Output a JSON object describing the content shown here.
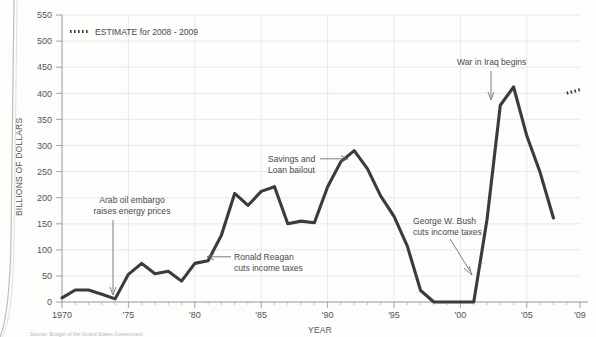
{
  "chart_data": {
    "type": "line",
    "title": "",
    "xlabel": "YEAR",
    "ylabel": "BILLIONS OF DOLLARS",
    "xlim": [
      1970,
      2009
    ],
    "ylim": [
      0,
      550
    ],
    "ytick_values": [
      0,
      50,
      100,
      150,
      200,
      250,
      300,
      350,
      400,
      450,
      500,
      550
    ],
    "ytick_labels": [
      "0",
      "50",
      "100",
      "150",
      "200",
      "250",
      "300",
      "350",
      "400",
      "450",
      "500",
      "550"
    ],
    "xtick_values": [
      1970,
      1975,
      1980,
      1985,
      1990,
      1995,
      2000,
      2005,
      2009
    ],
    "xtick_labels": [
      "1970",
      "'75",
      "'80",
      "'85",
      "'90",
      "'95",
      "'00",
      "'05",
      "'09"
    ],
    "grid": true,
    "legend_position": "top-left",
    "series": [
      {
        "name": "Deficit",
        "style": "solid",
        "x": [
          1970,
          1971,
          1972,
          1973,
          1974,
          1975,
          1976,
          1977,
          1978,
          1979,
          1980,
          1981,
          1982,
          1983,
          1984,
          1985,
          1986,
          1987,
          1988,
          1989,
          1990,
          1991,
          1992,
          1993,
          1994,
          1995,
          1996,
          1997,
          1998,
          1999,
          2000,
          2001,
          2002,
          2003,
          2004,
          2005,
          2006,
          2007
        ],
        "values": [
          8,
          23,
          23,
          15,
          6,
          53,
          74,
          54,
          59,
          40,
          74,
          79,
          128,
          208,
          185,
          212,
          221,
          150,
          155,
          152,
          221,
          269,
          290,
          255,
          203,
          164,
          107,
          22,
          0,
          0,
          0,
          0,
          158,
          377,
          412,
          318,
          248,
          161
        ]
      },
      {
        "name": "ESTIMATE for 2008 - 2009",
        "style": "dotted",
        "x": [
          2008,
          2009
        ],
        "values": [
          400,
          407
        ]
      }
    ],
    "legend": [
      {
        "label": "ESTIMATE for 2008 - 2009",
        "style": "dotted"
      }
    ],
    "annotations": [
      {
        "text_lines": [
          "Arab oil embargo",
          "raises energy prices"
        ],
        "text_x": 132,
        "text_y": 203,
        "anchor": "middle",
        "arrow": {
          "x1": 113,
          "y1": 215,
          "x2": 113,
          "y2": 295,
          "head": "down"
        }
      },
      {
        "text_lines": [
          "Ronald Reagan",
          "cuts income taxes"
        ],
        "text_x": 234,
        "text_y": 260,
        "anchor": "start",
        "arrow": {
          "x1": 230,
          "y1": 257,
          "x2": 208,
          "y2": 257,
          "head": "left"
        }
      },
      {
        "text_lines": [
          "Savings and",
          "Loan bailout"
        ],
        "text_x": 268,
        "text_y": 162,
        "anchor": "start",
        "arrow": {
          "x1": 322,
          "y1": 159,
          "x2": 345,
          "y2": 159,
          "head": "right"
        }
      },
      {
        "text_lines": [
          "George W. Bush",
          "cuts income taxes"
        ],
        "text_x": 413,
        "text_y": 224,
        "anchor": "start",
        "arrow": {
          "x1": 452,
          "y1": 238,
          "x2": 470,
          "y2": 272,
          "head": "down-right"
        }
      },
      {
        "text_lines": [
          "War in Iraq begins"
        ],
        "text_x": 457,
        "text_y": 65,
        "anchor": "start",
        "arrow": {
          "x1": 491,
          "y1": 72,
          "x2": 491,
          "y2": 100,
          "head": "down"
        }
      }
    ]
  },
  "caption": {
    "text": "Source: Budget of the United States Government"
  }
}
